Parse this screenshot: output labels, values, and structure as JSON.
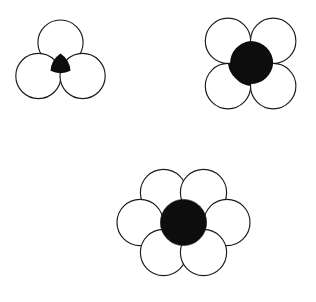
{
  "page": {
    "background_color": "#ffffff",
    "width": 316,
    "height": 302
  },
  "style": {
    "circle_fill": "#ffffff",
    "circle_stroke": "#1a1a1a",
    "circle_stroke_width": 1.15,
    "interstice_fill": "#0d0d0d"
  },
  "figures": [
    {
      "id": "figure-trefoil",
      "label": "three-circle packing",
      "arrangement": "triangular",
      "outer_count": 3,
      "outer_radius": 22.6,
      "outer_centers": [
        {
          "cx": 60.5,
          "cy": 42.6
        },
        {
          "cx": 38.4,
          "cy": 76.0
        },
        {
          "cx": 82.6,
          "cy": 76.0
        }
      ],
      "interstice": {
        "shape": "curvilinear-triangle",
        "cx": 60.5,
        "cy": 64.9,
        "inscribed_radius": 3.5,
        "cusps": [
          {
            "x": 60.5,
            "y": 53.5
          },
          {
            "x": 50.5,
            "y": 70.8
          },
          {
            "x": 70.5,
            "y": 70.8
          }
        ]
      }
    },
    {
      "id": "figure-square",
      "label": "four-circle packing",
      "arrangement": "square",
      "outer_count": 4,
      "outer_radius": 22.7,
      "outer_centers": [
        {
          "cx": 228.0,
          "cy": 40.9
        },
        {
          "cx": 273.2,
          "cy": 40.9
        },
        {
          "cx": 228.0,
          "cy": 86.1
        },
        {
          "cx": 273.2,
          "cy": 86.1
        }
      ],
      "interstice": {
        "shape": "curvilinear-square",
        "cx": 250.6,
        "cy": 63.5,
        "inscribed_radius": 9.4,
        "cusps": [
          {
            "x": 250.6,
            "y": 40.9
          },
          {
            "x": 250.6,
            "y": 86.1
          },
          {
            "x": 228.0,
            "y": 63.5
          },
          {
            "x": 273.2,
            "y": 63.5
          }
        ]
      }
    },
    {
      "id": "figure-hexagonal",
      "label": "seven-circle packing",
      "arrangement": "hexagonal",
      "outer_count": 6,
      "outer_radius": 23.1,
      "outer_centers": [
        {
          "cx": 163.5,
          "cy": 192.5
        },
        {
          "cx": 203.5,
          "cy": 192.5
        },
        {
          "cx": 140.1,
          "cy": 222.5
        },
        {
          "cx": 226.9,
          "cy": 222.5
        },
        {
          "cx": 163.5,
          "cy": 252.5
        },
        {
          "cx": 203.5,
          "cy": 252.5
        }
      ],
      "interstice": {
        "shape": "circle",
        "cx": 183.5,
        "cy": 222.5,
        "inscribed_radius": 23.1,
        "cusps": []
      }
    }
  ]
}
